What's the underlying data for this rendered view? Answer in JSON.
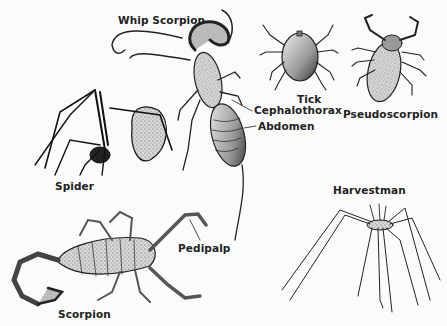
{
  "figure": {
    "background": "#fbfbfb",
    "ink": "#222222",
    "specimens": [
      {
        "id": "whip-scorpion",
        "label": "Whip Scorpion"
      },
      {
        "id": "tick",
        "label": "Tick"
      },
      {
        "id": "pseudoscorpion",
        "label": "Pseudoscorpion"
      },
      {
        "id": "spider",
        "label": "Spider"
      },
      {
        "id": "harvestman",
        "label": "Harvestman"
      },
      {
        "id": "scorpion",
        "label": "Scorpion"
      }
    ],
    "part_labels": {
      "cephalothorax": "Cephalothorax",
      "abdomen": "Abdomen",
      "pedipalp": "Pedipalp"
    }
  }
}
